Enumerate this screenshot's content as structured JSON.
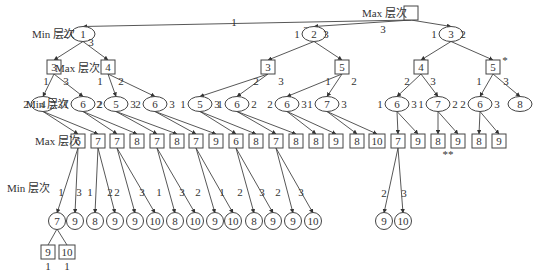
{
  "level_labels": [
    {
      "text": "Max 层次",
      "x": 362,
      "y": 17
    },
    {
      "text": "Min 层次",
      "x": 32,
      "y": 38
    },
    {
      "text": "Max 层次",
      "x": 55,
      "y": 72
    },
    {
      "text": "Min 层次",
      "x": 26,
      "y": 108
    },
    {
      "text": "Max 层次",
      "x": 35,
      "y": 145
    },
    {
      "text": "Min 层次",
      "x": 7,
      "y": 192
    }
  ],
  "nodes": [
    {
      "id": "root",
      "shape": "box",
      "x": 411,
      "y": 13,
      "w": 14,
      "h": 14,
      "label": ""
    },
    {
      "id": "m1",
      "shape": "ellipse",
      "x": 83,
      "y": 34,
      "label": "1",
      "left": "2",
      "right": "3",
      "lx": -14,
      "rx": 8,
      "ry": 8
    },
    {
      "id": "m2",
      "shape": "ellipse",
      "x": 314,
      "y": 34,
      "label": "2",
      "left": "1",
      "right": "3",
      "lx": -14,
      "rx": 12,
      "ry": 0
    },
    {
      "id": "m3",
      "shape": "ellipse",
      "x": 451,
      "y": 34,
      "label": "3",
      "left": "1",
      "right": "2",
      "lx": -14,
      "rx": 12,
      "ry": 0
    },
    {
      "id": "x1",
      "shape": "box",
      "x": 54,
      "y": 67,
      "w": 14,
      "h": 14,
      "label": "3"
    },
    {
      "id": "x2",
      "shape": "box",
      "x": 108,
      "y": 67,
      "w": 14,
      "h": 14,
      "label": "4"
    },
    {
      "id": "x3",
      "shape": "box",
      "x": 268,
      "y": 67,
      "w": 14,
      "h": 14,
      "label": "3"
    },
    {
      "id": "x4",
      "shape": "box",
      "x": 342,
      "y": 67,
      "w": 14,
      "h": 14,
      "label": "5"
    },
    {
      "id": "x5",
      "shape": "box",
      "x": 421,
      "y": 67,
      "w": 14,
      "h": 14,
      "label": "4"
    },
    {
      "id": "x6",
      "shape": "box",
      "x": 493,
      "y": 67,
      "w": 14,
      "h": 14,
      "label": "5",
      "mark": "*"
    },
    {
      "id": "n1",
      "shape": "ellipse",
      "x": 43,
      "y": 104,
      "label": "4",
      "left": "2",
      "right": "3"
    },
    {
      "id": "n2",
      "shape": "ellipse",
      "x": 83,
      "y": 104,
      "label": "6",
      "left": "1",
      "right": "2"
    },
    {
      "id": "n3",
      "shape": "ellipse",
      "x": 116,
      "y": 104,
      "label": "5",
      "left": "2",
      "right": "3"
    },
    {
      "id": "n4",
      "shape": "ellipse",
      "x": 155,
      "y": 104,
      "label": "6",
      "left": "2",
      "right": "3"
    },
    {
      "id": "n5",
      "shape": "ellipse",
      "x": 200,
      "y": 104,
      "label": "5",
      "left": "1",
      "right": "3"
    },
    {
      "id": "n6",
      "shape": "ellipse",
      "x": 237,
      "y": 104,
      "label": "6",
      "left": "1",
      "right": "2"
    },
    {
      "id": "n7",
      "shape": "ellipse",
      "x": 287,
      "y": 104,
      "label": "6",
      "left": "2",
      "right": "3"
    },
    {
      "id": "n8",
      "shape": "ellipse",
      "x": 327,
      "y": 104,
      "label": "7",
      "left": "1",
      "right": "3"
    },
    {
      "id": "n9",
      "shape": "ellipse",
      "x": 397,
      "y": 104,
      "label": "6",
      "left": "1",
      "right": "3"
    },
    {
      "id": "n10",
      "shape": "ellipse",
      "x": 438,
      "y": 104,
      "label": "7",
      "left": "1",
      "right": "2"
    },
    {
      "id": "n11",
      "shape": "ellipse",
      "x": 480,
      "y": 104,
      "label": "6",
      "left": "2",
      "right": "3"
    },
    {
      "id": "n12",
      "shape": "ellipse",
      "x": 520,
      "y": 104,
      "label": "8",
      "left": "",
      "right": ""
    },
    {
      "id": "y1",
      "shape": "box",
      "x": 78,
      "y": 141,
      "w": 14,
      "h": 14,
      "label": "6"
    },
    {
      "id": "y2",
      "shape": "box",
      "x": 98,
      "y": 141,
      "w": 14,
      "h": 14,
      "label": "7"
    },
    {
      "id": "y3",
      "shape": "box",
      "x": 117,
      "y": 141,
      "w": 14,
      "h": 14,
      "label": "7"
    },
    {
      "id": "y4",
      "shape": "box",
      "x": 137,
      "y": 141,
      "w": 14,
      "h": 14,
      "label": "8"
    },
    {
      "id": "y5",
      "shape": "box",
      "x": 157,
      "y": 141,
      "w": 14,
      "h": 14,
      "label": "7"
    },
    {
      "id": "y6",
      "shape": "box",
      "x": 177,
      "y": 141,
      "w": 14,
      "h": 14,
      "label": "8"
    },
    {
      "id": "y7",
      "shape": "box",
      "x": 196,
      "y": 141,
      "w": 14,
      "h": 14,
      "label": "7"
    },
    {
      "id": "y8",
      "shape": "box",
      "x": 216,
      "y": 141,
      "w": 14,
      "h": 14,
      "label": "9"
    },
    {
      "id": "y9",
      "shape": "box",
      "x": 236,
      "y": 141,
      "w": 14,
      "h": 14,
      "label": "6"
    },
    {
      "id": "y10",
      "shape": "box",
      "x": 256,
      "y": 141,
      "w": 14,
      "h": 14,
      "label": "8"
    },
    {
      "id": "y11",
      "shape": "box",
      "x": 276,
      "y": 141,
      "w": 14,
      "h": 14,
      "label": "7"
    },
    {
      "id": "y12",
      "shape": "box",
      "x": 296,
      "y": 141,
      "w": 14,
      "h": 14,
      "label": "8"
    },
    {
      "id": "y13",
      "shape": "box",
      "x": 316,
      "y": 141,
      "w": 14,
      "h": 14,
      "label": "8"
    },
    {
      "id": "y14",
      "shape": "box",
      "x": 336,
      "y": 141,
      "w": 14,
      "h": 14,
      "label": "9"
    },
    {
      "id": "y15",
      "shape": "box",
      "x": 357,
      "y": 141,
      "w": 14,
      "h": 14,
      "label": "8"
    },
    {
      "id": "y16",
      "shape": "box",
      "x": 377,
      "y": 141,
      "w": 16,
      "h": 14,
      "label": "10"
    },
    {
      "id": "y17",
      "shape": "box",
      "x": 398,
      "y": 141,
      "w": 14,
      "h": 14,
      "label": "7"
    },
    {
      "id": "y18",
      "shape": "box",
      "x": 418,
      "y": 141,
      "w": 14,
      "h": 14,
      "label": "9"
    },
    {
      "id": "y19",
      "shape": "box",
      "x": 438,
      "y": 141,
      "w": 14,
      "h": 14,
      "label": "8"
    },
    {
      "id": "y20",
      "shape": "box",
      "x": 458,
      "y": 141,
      "w": 14,
      "h": 14,
      "label": "9",
      "mark_below": "**"
    },
    {
      "id": "y21",
      "shape": "box",
      "x": 479,
      "y": 141,
      "w": 14,
      "h": 14,
      "label": "8"
    },
    {
      "id": "y22",
      "shape": "box",
      "x": 499,
      "y": 141,
      "w": 14,
      "h": 14,
      "label": "9"
    },
    {
      "id": "z1",
      "shape": "circle",
      "x": 57,
      "y": 221,
      "label": "7"
    },
    {
      "id": "z2",
      "shape": "circle",
      "x": 75,
      "y": 221,
      "label": "9"
    },
    {
      "id": "z3",
      "shape": "circle",
      "x": 95,
      "y": 221,
      "label": "8"
    },
    {
      "id": "z4",
      "shape": "circle",
      "x": 115,
      "y": 221,
      "label": "9"
    },
    {
      "id": "z5",
      "shape": "circle",
      "x": 135,
      "y": 221,
      "label": "9"
    },
    {
      "id": "z6",
      "shape": "circle",
      "x": 155,
      "y": 221,
      "label": "10"
    },
    {
      "id": "z7",
      "shape": "circle",
      "x": 175,
      "y": 221,
      "label": "8"
    },
    {
      "id": "z8",
      "shape": "circle",
      "x": 195,
      "y": 221,
      "label": "10"
    },
    {
      "id": "z9",
      "shape": "circle",
      "x": 215,
      "y": 221,
      "label": "9"
    },
    {
      "id": "z10",
      "shape": "circle",
      "x": 233,
      "y": 221,
      "label": "10"
    },
    {
      "id": "z11",
      "shape": "circle",
      "x": 254,
      "y": 221,
      "label": "8"
    },
    {
      "id": "z12",
      "shape": "circle",
      "x": 273,
      "y": 221,
      "label": "9"
    },
    {
      "id": "z13",
      "shape": "circle",
      "x": 293,
      "y": 221,
      "label": "9"
    },
    {
      "id": "z14",
      "shape": "circle",
      "x": 313,
      "y": 221,
      "label": "10"
    },
    {
      "id": "z15",
      "shape": "circle",
      "x": 384,
      "y": 221,
      "label": "9"
    },
    {
      "id": "z16",
      "shape": "circle",
      "x": 403,
      "y": 221,
      "label": "10"
    },
    {
      "id": "w1",
      "shape": "box",
      "x": 48,
      "y": 252,
      "w": 14,
      "h": 14,
      "label": "9",
      "below": "1"
    },
    {
      "id": "w2",
      "shape": "box",
      "x": 67,
      "y": 252,
      "w": 16,
      "h": 14,
      "label": "10",
      "below": "1"
    }
  ],
  "edges": [
    {
      "from": "root",
      "to": "m1",
      "label": "1",
      "lx": 234,
      "ly": 26
    },
    {
      "from": "root",
      "to": "m2",
      "label": "2",
      "lx": 306,
      "ly": 34
    },
    {
      "from": "root",
      "to": "m3",
      "label": "3",
      "lx": 383,
      "ly": 33
    },
    {
      "from": "m1",
      "to": "x1",
      "label": "",
      "lx": 0,
      "ly": 0
    },
    {
      "from": "m1",
      "to": "x2",
      "label": "",
      "lx": 0,
      "ly": 0
    },
    {
      "from": "m2",
      "to": "x3",
      "label": "",
      "lx": 0,
      "ly": 0
    },
    {
      "from": "m2",
      "to": "x4",
      "label": "",
      "lx": 0,
      "ly": 0
    },
    {
      "from": "m3",
      "to": "x5",
      "label": "",
      "lx": 0,
      "ly": 0
    },
    {
      "from": "m3",
      "to": "x6",
      "label": "",
      "lx": 0,
      "ly": 0
    },
    {
      "from": "x1",
      "to": "n1",
      "label": "1",
      "lx": 46,
      "ly": 85
    },
    {
      "from": "x1",
      "to": "n2",
      "label": "3",
      "lx": 66,
      "ly": 85
    },
    {
      "from": "x2",
      "to": "n3",
      "label": "1",
      "lx": 100,
      "ly": 85
    },
    {
      "from": "x2",
      "to": "n4",
      "label": "2",
      "lx": 121,
      "ly": 85
    },
    {
      "from": "x3",
      "to": "n5",
      "label": "2",
      "lx": 256,
      "ly": 85
    },
    {
      "from": "x3",
      "to": "n6",
      "label": "3",
      "lx": 281,
      "ly": 85
    },
    {
      "from": "x4",
      "to": "n7",
      "label": "1",
      "lx": 328,
      "ly": 85
    },
    {
      "from": "x4",
      "to": "n8",
      "label": "2",
      "lx": 354,
      "ly": 85
    },
    {
      "from": "x5",
      "to": "n9",
      "label": "2",
      "lx": 407,
      "ly": 85
    },
    {
      "from": "x5",
      "to": "n10",
      "label": "3",
      "lx": 433,
      "ly": 85
    },
    {
      "from": "x6",
      "to": "n11",
      "label": "1",
      "lx": 479,
      "ly": 85
    },
    {
      "from": "x6",
      "to": "n12",
      "label": "3",
      "lx": 506,
      "ly": 85
    },
    {
      "from": "n1",
      "to": "y1"
    },
    {
      "from": "n1",
      "to": "y2"
    },
    {
      "from": "n2",
      "to": "y3"
    },
    {
      "from": "n2",
      "to": "y4"
    },
    {
      "from": "n3",
      "to": "y5"
    },
    {
      "from": "n3",
      "to": "y6"
    },
    {
      "from": "n4",
      "to": "y7"
    },
    {
      "from": "n4",
      "to": "y8"
    },
    {
      "from": "n5",
      "to": "y9"
    },
    {
      "from": "n5",
      "to": "y10"
    },
    {
      "from": "n6",
      "to": "y11"
    },
    {
      "from": "n6",
      "to": "y12"
    },
    {
      "from": "n7",
      "to": "y13"
    },
    {
      "from": "n7",
      "to": "y14"
    },
    {
      "from": "n8",
      "to": "y15"
    },
    {
      "from": "n8",
      "to": "y16"
    },
    {
      "from": "n9",
      "to": "y17"
    },
    {
      "from": "n9",
      "to": "y18"
    },
    {
      "from": "n10",
      "to": "y19"
    },
    {
      "from": "n10",
      "to": "y20"
    },
    {
      "from": "n11",
      "to": "y21"
    },
    {
      "from": "n11",
      "to": "y22"
    },
    {
      "from": "y1",
      "to": "z1",
      "label": "1",
      "lx": 61,
      "ly": 196
    },
    {
      "from": "y1",
      "to": "z2",
      "label": "3",
      "lx": 79,
      "ly": 196
    },
    {
      "from": "y2",
      "to": "z3",
      "label": "1",
      "lx": 90,
      "ly": 196
    },
    {
      "from": "y2",
      "to": "z4",
      "label": "2",
      "lx": 110,
      "ly": 196
    },
    {
      "from": "y3",
      "to": "z5",
      "label": "2",
      "lx": 117,
      "ly": 196
    },
    {
      "from": "y3",
      "to": "z6",
      "label": "3",
      "lx": 142,
      "ly": 196
    },
    {
      "from": "y5",
      "to": "z7",
      "label": "1",
      "lx": 159,
      "ly": 196
    },
    {
      "from": "y5",
      "to": "z8",
      "label": "3",
      "lx": 182,
      "ly": 196
    },
    {
      "from": "y7",
      "to": "z9",
      "label": "2",
      "lx": 198,
      "ly": 196
    },
    {
      "from": "y7",
      "to": "z10",
      "label": "1",
      "lx": 222,
      "ly": 196
    },
    {
      "from": "y9",
      "to": "z11",
      "label": "2",
      "lx": 240,
      "ly": 196
    },
    {
      "from": "y9",
      "to": "z12",
      "label": "3",
      "lx": 262,
      "ly": 196
    },
    {
      "from": "y11",
      "to": "z13",
      "label": "2",
      "lx": 278,
      "ly": 196
    },
    {
      "from": "y11",
      "to": "z14",
      "label": "3",
      "lx": 301,
      "ly": 196
    },
    {
      "from": "y17",
      "to": "z15",
      "label": "2",
      "lx": 384,
      "ly": 197
    },
    {
      "from": "y17",
      "to": "z16",
      "label": "3",
      "lx": 404,
      "ly": 197
    },
    {
      "from": "z1",
      "to": "w1",
      "noarrow": true
    },
    {
      "from": "z1",
      "to": "w2",
      "noarrow": true
    }
  ]
}
